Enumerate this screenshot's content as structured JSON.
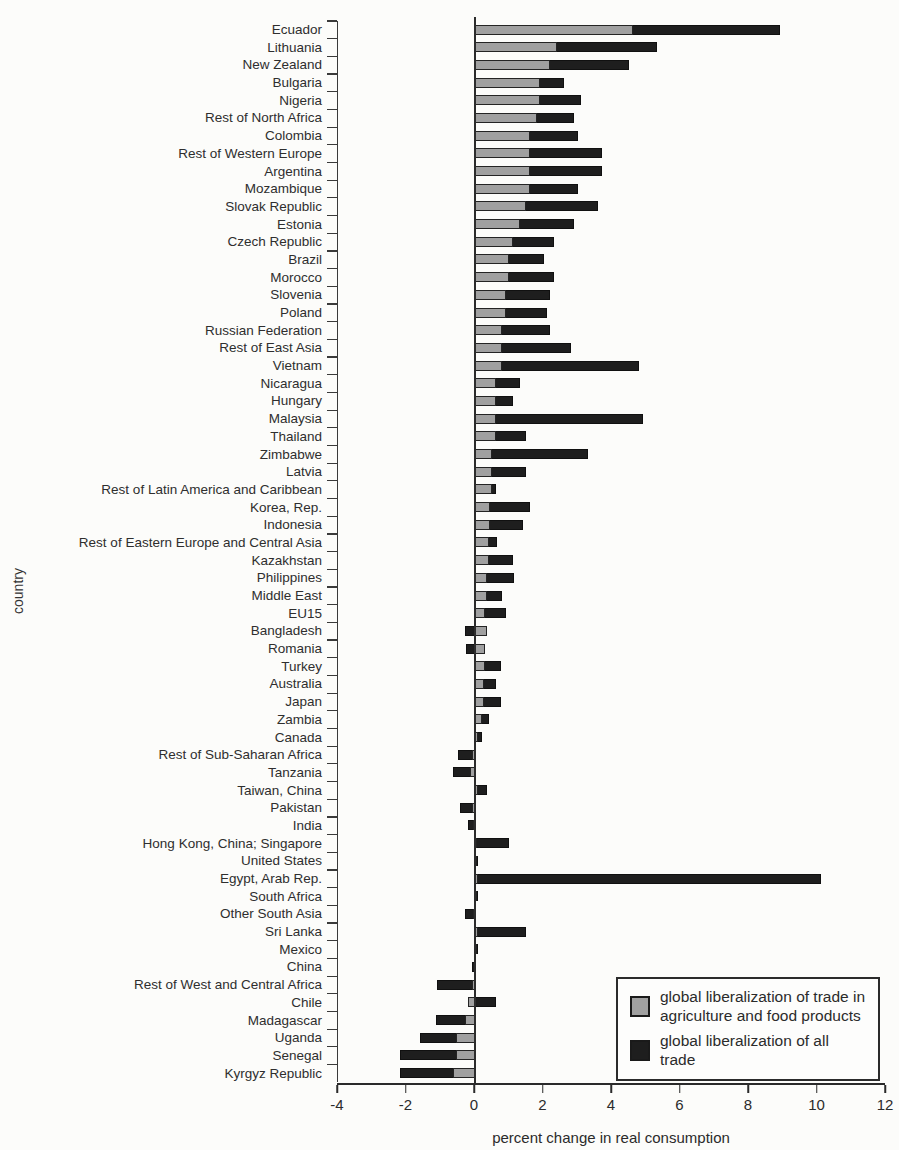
{
  "figure": {
    "y_axis_label": "country",
    "x_axis_label": "percent change in real consumption",
    "x_ticks": [
      -4,
      -2,
      0,
      2,
      4,
      6,
      8,
      10,
      12
    ]
  },
  "legend": {
    "items": [
      {
        "label": "global liberalization of trade in agriculture and food products",
        "color": "#a0a0a0"
      },
      {
        "label": "global liberalization of all trade",
        "color": "#1e1e1e"
      }
    ]
  },
  "chart_data": {
    "type": "bar",
    "orientation": "horizontal",
    "title": "",
    "xlabel": "percent change in real consumption",
    "ylabel": "country",
    "xlim": [
      -4,
      12
    ],
    "x_ticks": [
      -4,
      -2,
      0,
      2,
      4,
      6,
      8,
      10,
      12
    ],
    "grid": false,
    "legend_position": "lower right",
    "bar_style": "overlapped-from-zero",
    "categories": [
      "Ecuador",
      "Lithuania",
      "New Zealand",
      "Bulgaria",
      "Nigeria",
      "Rest of North Africa",
      "Colombia",
      "Rest of Western Europe",
      "Argentina",
      "Mozambique",
      "Slovak Republic",
      "Estonia",
      "Czech Republic",
      "Brazil",
      "Morocco",
      "Slovenia",
      "Poland",
      "Russian Federation",
      "Rest of East Asia",
      "Vietnam",
      "Nicaragua",
      "Hungary",
      "Malaysia",
      "Thailand",
      "Zimbabwe",
      "Latvia",
      "Rest of Latin America and Caribbean",
      "Korea, Rep.",
      "Indonesia",
      "Rest of Eastern Europe and Central Asia",
      "Kazakhstan",
      "Philippines",
      "Middle East",
      "EU15",
      "Bangladesh",
      "Romania",
      "Turkey",
      "Australia",
      "Japan",
      "Zambia",
      "Canada",
      "Rest of Sub-Saharan Africa",
      "Tanzania",
      "Taiwan, China",
      "Pakistan",
      "India",
      "Hong Kong, China; Singapore",
      "United States",
      "Egypt, Arab Rep.",
      "South Africa",
      "Other South Asia",
      "Sri Lanka",
      "Mexico",
      "China",
      "Rest of West and Central Africa",
      "Chile",
      "Madagascar",
      "Uganda",
      "Senegal",
      "Kyrgyz Republic"
    ],
    "series": [
      {
        "name": "global liberalization of trade in agriculture and food products",
        "color": "#a0a0a0",
        "values": [
          4.6,
          2.4,
          2.2,
          1.9,
          1.9,
          1.8,
          1.6,
          1.6,
          1.6,
          1.6,
          1.5,
          1.3,
          1.1,
          1.0,
          1.0,
          0.9,
          0.9,
          0.8,
          0.8,
          0.8,
          0.6,
          0.6,
          0.6,
          0.6,
          0.5,
          0.5,
          0.5,
          0.45,
          0.45,
          0.4,
          0.4,
          0.35,
          0.35,
          0.3,
          0.35,
          0.3,
          0.3,
          0.25,
          0.25,
          0.2,
          0.1,
          -0.1,
          -0.15,
          0.1,
          -0.1,
          -0.05,
          0.05,
          0.05,
          0.1,
          0.03,
          -0.05,
          0.1,
          0.05,
          -0.03,
          -0.1,
          -0.2,
          -0.3,
          -0.55,
          -0.55,
          -0.65
        ]
      },
      {
        "name": "global liberalization of all trade",
        "color": "#1e1e1e",
        "values": [
          8.9,
          5.3,
          4.5,
          2.6,
          3.1,
          2.9,
          3.0,
          3.7,
          3.7,
          3.0,
          3.6,
          2.9,
          2.3,
          2.0,
          2.3,
          2.2,
          2.1,
          2.2,
          2.8,
          4.8,
          1.3,
          1.1,
          4.9,
          1.5,
          3.3,
          1.5,
          0.6,
          1.6,
          1.4,
          0.65,
          1.1,
          1.15,
          0.8,
          0.9,
          -0.3,
          -0.25,
          0.75,
          0.6,
          0.75,
          0.4,
          0.2,
          -0.5,
          -0.65,
          0.35,
          -0.45,
          -0.2,
          1.0,
          0.1,
          10.1,
          0.08,
          -0.3,
          1.5,
          0.1,
          -0.1,
          -1.1,
          0.6,
          -1.15,
          -1.6,
          -2.2,
          -2.2
        ]
      }
    ]
  }
}
